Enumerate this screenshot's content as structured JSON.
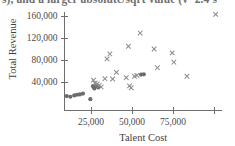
{
  "caption": {
    "text": "s), and a larger absolute/sqrt value (v=2.4 s"
  },
  "chart_data": {
    "type": "scatter",
    "title": "",
    "xlabel": "Talent Cost",
    "ylabel": "Total Revenue",
    "xlim": [
      0,
      110000
    ],
    "ylim": [
      0,
      172000
    ],
    "xticks": [
      25000,
      50000,
      75000,
      100000
    ],
    "xtick_labels": [
      "25,000",
      "50,000",
      "75,000",
      ""
    ],
    "yticks": [
      40000,
      80000,
      120000,
      160000
    ],
    "ytick_labels": [
      "40,000",
      "80,000",
      "120,000",
      "160,000"
    ],
    "grid": false,
    "legend": "none",
    "marker_colors": {
      "cross": "#8c8c8c",
      "dot": "#6b6b6b"
    },
    "series": [
      {
        "name": "low-cost group",
        "marker": "filled-circle",
        "points": [
          [
            10200,
            14500
          ],
          [
            12400,
            13200
          ],
          [
            14800,
            15600
          ],
          [
            16500,
            16800
          ],
          [
            18200,
            17400
          ],
          [
            20100,
            19000
          ],
          [
            24600,
            8800
          ],
          [
            26200,
            32500
          ],
          [
            27000,
            28200
          ],
          [
            28100,
            33000
          ],
          [
            29400,
            30000
          ],
          [
            55500,
            53500
          ],
          [
            57200,
            54000
          ]
        ]
      },
      {
        "name": "main group",
        "marker": "cross",
        "points": [
          [
            26500,
            43500
          ],
          [
            27400,
            38000
          ],
          [
            28800,
            36500
          ],
          [
            30000,
            34000
          ],
          [
            31200,
            31000
          ],
          [
            33500,
            46000
          ],
          [
            34800,
            82000
          ],
          [
            36500,
            91000
          ],
          [
            38200,
            45500
          ],
          [
            40500,
            57500
          ],
          [
            46500,
            48000
          ],
          [
            47800,
            105000
          ],
          [
            48500,
            33000
          ],
          [
            49500,
            29500
          ],
          [
            51500,
            50500
          ],
          [
            53000,
            52000
          ],
          [
            55000,
            129000
          ],
          [
            63500,
            100000
          ],
          [
            65500,
            66000
          ],
          [
            74500,
            93000
          ],
          [
            75500,
            76000
          ],
          [
            83500,
            50500
          ],
          [
            101000,
            163000
          ]
        ]
      }
    ]
  }
}
